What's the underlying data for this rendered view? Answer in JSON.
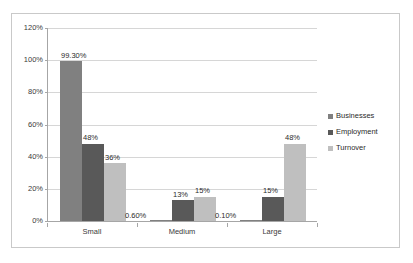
{
  "chart_data": {
    "type": "bar",
    "title": "",
    "subtitle": "",
    "xlabel": "",
    "ylabel": "",
    "categories": [
      "Small",
      "Medium",
      "Large"
    ],
    "ylim": [
      0,
      120
    ],
    "ytick_labels": [
      "0%",
      "20%",
      "40%",
      "60%",
      "80%",
      "100%",
      "120%"
    ],
    "ytick_values": [
      0,
      20,
      40,
      60,
      80,
      100,
      120
    ],
    "grid": true,
    "legend_position": "right",
    "series": [
      {
        "name": "Businesses",
        "color": "#808080",
        "values": [
          99.3,
          0.6,
          0.1
        ],
        "labels": [
          "99.30%",
          "0.60%",
          "0.10%"
        ]
      },
      {
        "name": "Employment",
        "color": "#595959",
        "values": [
          48,
          13,
          15
        ],
        "labels": [
          "48%",
          "13%",
          "15%"
        ]
      },
      {
        "name": "Turnover",
        "color": "#bfbfbf",
        "values": [
          36,
          15,
          48
        ],
        "labels": [
          "36%",
          "15%",
          "48%"
        ]
      }
    ]
  }
}
